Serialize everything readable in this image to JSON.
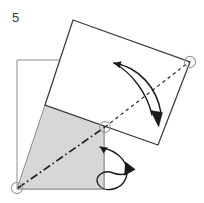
{
  "figure": {
    "step_label": "5",
    "kind": "origami-fold-instruction",
    "canvas": {
      "width": 204,
      "height": 203
    },
    "background_color": "#ffffff"
  },
  "colors": {
    "outline_dark": "#3c3c3c",
    "outline_light": "#8c8c8c",
    "shade_fill": "#d7d7d7",
    "shade_stroke": "#8a8a8a",
    "arrow_color": "#1a1a1a",
    "dashed_color": "#2b2b2b",
    "chain_color": "#1f1f1f",
    "marker_stroke": "#9a9a9a",
    "paper_fill": "#ffffff",
    "text_color": "#3a3a3a"
  },
  "shapes": {
    "base_square": {
      "name": "underlying-square-outline",
      "points": "17,60 104,60 104,189 17,189",
      "stroke": "#8c8c8c",
      "stroke_width": 1,
      "fill": "none"
    },
    "rotated_square": {
      "name": "rotated-folded-square",
      "points": "73,20 190,62 158,145 45,105",
      "stroke": "#3c3c3c",
      "stroke_width": 1.3,
      "fill": "#ffffff"
    },
    "shaded_triangle": {
      "name": "shaded-fold-region",
      "points": "45,105 104,126 104,189 17,189",
      "fill": "#d7d7d7",
      "stroke": "#8a8a8a",
      "stroke_width": 1
    }
  },
  "lines": {
    "dashed_diagonal": {
      "name": "dashed-fold-diagonal",
      "x1": 105,
      "y1": 127,
      "x2": 189,
      "y2": 62,
      "dash": "3.4 3.2",
      "stroke": "#2b2b2b",
      "stroke_width": 1.2
    },
    "chain_diagonal": {
      "name": "chain-dash-dot-crease",
      "x1": 18,
      "y1": 188,
      "x2": 105,
      "y2": 127,
      "dash": "8 3 1.6 3",
      "stroke": "#1f1f1f",
      "stroke_width": 1.6
    }
  },
  "markers": [
    {
      "name": "corner-marker-top-right",
      "cx": 190,
      "cy": 62,
      "r": 5.6
    },
    {
      "name": "corner-marker-center",
      "cx": 105,
      "cy": 127,
      "r": 5.4
    },
    {
      "name": "corner-marker-bottom-left",
      "cx": 17,
      "cy": 188,
      "r": 5.6
    }
  ],
  "arrows": {
    "main_fold_arrow": {
      "name": "main-fold-arrow",
      "description": "large curved arrow indicating the corner folding down-right",
      "path": "M 114 63 C 138 66 156 86 161 114",
      "head_points": "156.6,108.5 166.5,110.2 162.2,123.5",
      "stroke": "#1a1a1a",
      "stroke_width": 1.5,
      "tail_path": "M 114 63 C 133 72 148 92 153 116"
    },
    "flip_loop_arrow": {
      "name": "flip-loop-arrow",
      "description": "small looping arrow indicating turning the flap over",
      "path": "M 100 148 C 119 152 129 166 124 179 C 118 192 101 192 97 183 C 94 175 103 170 112 174 C 120 177 126 176 131 170",
      "head_points": "126.2,163.5 134.5,170.6 124.8,175.4",
      "stroke": "#1a1a1a",
      "stroke_width": 1.4
    }
  }
}
